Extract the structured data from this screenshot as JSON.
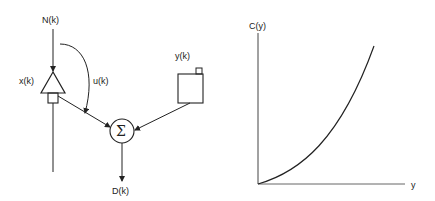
{
  "block_diagram": {
    "labels": {
      "input_top": "N(k)",
      "amplifier": "x(k)",
      "feedback": "u(k)",
      "source": "y(k)",
      "summer_symbol": "Σ",
      "output": "D(k)"
    }
  },
  "graph": {
    "y_axis_label": "C(y)",
    "x_axis_label": "y",
    "curve": "increasing convex curve from origin"
  },
  "colors": {
    "ink": "#222222",
    "background": "#ffffff"
  }
}
